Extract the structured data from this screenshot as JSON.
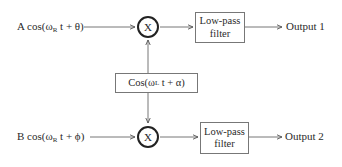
{
  "diagram": {
    "inputs": {
      "top": {
        "prefix": "A cos(ω",
        "sub": "R",
        "suffix": " t + θ)"
      },
      "bottom": {
        "prefix": "B cos(ω",
        "sub": "R",
        "suffix": " t + ϕ)"
      }
    },
    "oscillator": {
      "prefix": "Cos(ω",
      "sub": "L",
      "suffix": " t + α)"
    },
    "multipliers": {
      "top": "X",
      "bottom": "X"
    },
    "filters": {
      "top": {
        "line1": "Low-pass",
        "line2": "filter"
      },
      "bottom": {
        "line1": "Low-pass",
        "line2": "filter"
      }
    },
    "outputs": {
      "top": "Output 1",
      "bottom": "Output 2"
    },
    "colors": {
      "line": "#777777",
      "circle": "#222222",
      "text": "#2a2a2a"
    }
  }
}
